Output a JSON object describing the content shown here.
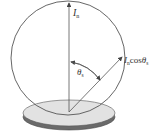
{
  "diagram": {
    "labels": {
      "normal_intensity": "I",
      "normal_intensity_sub": "n",
      "oblique_intensity": "I",
      "oblique_intensity_sub": "n",
      "oblique_intensity_rest": "cos",
      "oblique_theta": "θ",
      "oblique_theta_sub": "s",
      "angle": "θ",
      "angle_sub": "s"
    },
    "colors": {
      "stroke": "#555555",
      "disk_top": "#e2e2e2",
      "disk_rim": "#6a6a6a"
    }
  }
}
